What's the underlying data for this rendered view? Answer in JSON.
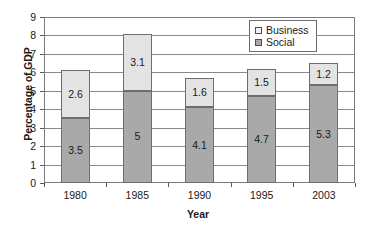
{
  "chart_data": {
    "type": "bar",
    "subtype": "stacked-bar",
    "title": "",
    "xlabel": "Year",
    "ylabel": "Percentage of GDP",
    "categories": [
      "1980",
      "1985",
      "1990",
      "1995",
      "2003"
    ],
    "series": [
      {
        "name": "Social",
        "values": [
          3.5,
          5,
          4.1,
          4.7,
          5.3
        ],
        "labels": [
          "3.5",
          "5",
          "4.1",
          "4.7",
          "5.3"
        ],
        "color": "#a9a9a9",
        "legend_swatch": "#a9a9a9"
      },
      {
        "name": "Business",
        "values": [
          2.6,
          3.1,
          1.6,
          1.5,
          1.2
        ],
        "labels": [
          "2.6",
          "3.1",
          "1.6",
          "1.5",
          "1.2"
        ],
        "color": "#e3e3e3",
        "legend_swatch": "#f2f2f2"
      }
    ],
    "totals": [
      6.1,
      8.1,
      5.7,
      6.2,
      6.5
    ],
    "ylim": [
      0,
      9
    ],
    "ytick_labels": [
      "0",
      "1",
      "2",
      "3",
      "4",
      "5",
      "6",
      "7",
      "8",
      "9"
    ],
    "ytick_values": [
      0,
      1,
      2,
      3,
      4,
      5,
      6,
      7,
      8,
      9
    ],
    "grid": true,
    "grid_axis": "y",
    "legend_position": "top-right",
    "legend_entries": [
      "Business",
      "Social"
    ],
    "axis_color": "#7a7a7a",
    "grid_color": "#8a8a8a",
    "bar_border_color": "#6e6e6e",
    "background": "#ffffff"
  }
}
